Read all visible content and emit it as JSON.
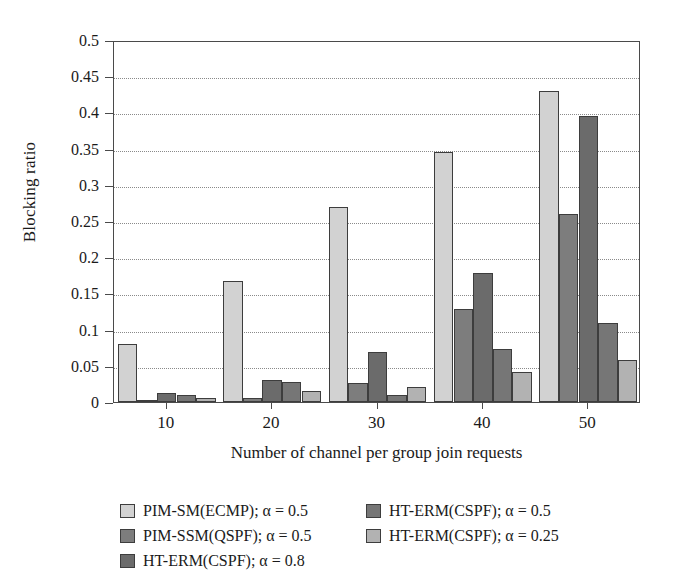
{
  "chart_data": {
    "type": "bar",
    "title": "",
    "xlabel": "Number of channel per group join requests",
    "ylabel": "Blocking ratio",
    "categories": [
      "10",
      "20",
      "30",
      "40",
      "50"
    ],
    "ylim": [
      0,
      0.5
    ],
    "yticks": [
      "0",
      "0.05",
      "0.1",
      "0.15",
      "0.2",
      "0.25",
      "0.3",
      "0.35",
      "0.4",
      "0.45",
      "0.5"
    ],
    "ytick_values": [
      0,
      0.05,
      0.1,
      0.15,
      0.2,
      0.25,
      0.3,
      0.35,
      0.4,
      0.45,
      0.5
    ],
    "grid": true,
    "legend_position": "bottom",
    "series": [
      {
        "name": "PIM-SM(ECMP); α = 0.5",
        "color": "#d2d2d2",
        "values": [
          0.08,
          0.167,
          0.269,
          0.345,
          0.43
        ]
      },
      {
        "name": "PIM-SSM(QSPF); α = 0.5",
        "color": "#7d7d7d",
        "values": [
          0.003,
          0.005,
          0.026,
          0.129,
          0.259
        ]
      },
      {
        "name": "HT-ERM(CSPF); α = 0.8",
        "color": "#6b6b6b",
        "values": [
          0.012,
          0.03,
          0.069,
          0.178,
          0.395
        ]
      },
      {
        "name": "HT-ERM(CSPF); α = 0.5",
        "color": "#767676",
        "values": [
          0.009,
          0.027,
          0.01,
          0.073,
          0.109
        ]
      },
      {
        "name": "HT-ERM(CSPF); α = 0.25",
        "color": "#b2b2b2",
        "values": [
          0.006,
          0.015,
          0.021,
          0.042,
          0.058
        ]
      }
    ]
  },
  "legend": {
    "items": [
      {
        "label": "PIM-SM(ECMP); α = 0.5",
        "color": "#d2d2d2"
      },
      {
        "label": "HT-ERM(CSPF); α = 0.5",
        "color": "#767676"
      },
      {
        "label": "PIM-SSM(QSPF); α = 0.5",
        "color": "#7d7d7d"
      },
      {
        "label": "HT-ERM(CSPF); α = 0.25",
        "color": "#b2b2b2"
      },
      {
        "label": "HT-ERM(CSPF); α = 0.8",
        "color": "#6b6b6b"
      }
    ]
  },
  "axes": {
    "y_title": "Blocking ratio",
    "x_title": "Number of channel per group join requests"
  }
}
